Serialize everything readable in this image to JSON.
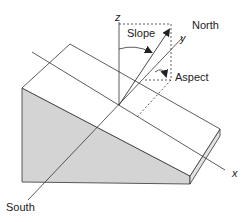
{
  "diagram": {
    "labels": {
      "z_axis": "z",
      "y_axis": "y",
      "x_axis": "x",
      "slope": "Slope",
      "aspect": "Aspect",
      "north": "North",
      "south": "South"
    },
    "colors": {
      "line": "#333333",
      "side_fill": "#d4d4d4",
      "top_fill": "#ffffff",
      "edge_fill": "#e2e2e2"
    }
  }
}
